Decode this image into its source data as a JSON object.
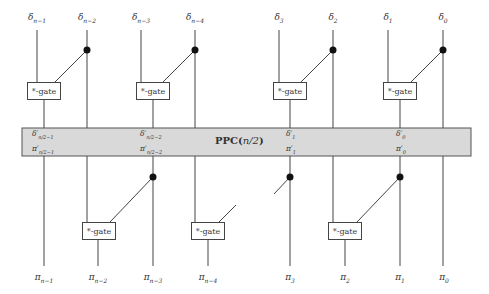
{
  "diagram": {
    "title": "PPC(n/2)",
    "band": {
      "label_prefix": "PPC(",
      "label_var": "n/2",
      "label_suffix": ")",
      "color": "#d9d9d9",
      "border": "#555555"
    },
    "gate_label": "*-gate",
    "inputs": [
      {
        "sym": "δ",
        "sub": "n−1",
        "x": 37
      },
      {
        "sym": "δ",
        "sub": "n−2",
        "x": 87
      },
      {
        "sym": "δ",
        "sub": "n−3",
        "x": 141
      },
      {
        "sym": "δ",
        "sub": "n−4",
        "x": 195
      },
      {
        "sym": "δ",
        "sub": "3",
        "x": 279
      },
      {
        "sym": "δ",
        "sub": "2",
        "x": 333
      },
      {
        "sym": "δ",
        "sub": "1",
        "x": 388
      },
      {
        "sym": "δ",
        "sub": "0",
        "x": 443
      }
    ],
    "outputs": [
      {
        "sym": "π",
        "sub": "n−1",
        "x": 44
      },
      {
        "sym": "π",
        "sub": "n−2",
        "x": 98
      },
      {
        "sym": "π",
        "sub": "n−3",
        "x": 153
      },
      {
        "sym": "π",
        "sub": "n−4",
        "x": 208
      },
      {
        "sym": "π",
        "sub": "3",
        "x": 290
      },
      {
        "sym": "π",
        "sub": "2",
        "x": 345
      },
      {
        "sym": "π",
        "sub": "1",
        "x": 400
      },
      {
        "sym": "π",
        "sub": "0",
        "x": 444
      }
    ],
    "band_labels_top": [
      {
        "sym": "δ′",
        "sub": "n/2−1",
        "x": 32
      },
      {
        "sym": "δ′",
        "sub": "n/2−2",
        "x": 140
      },
      {
        "sym": "δ′",
        "sub": "1",
        "x": 287
      },
      {
        "sym": "δ′",
        "sub": "0",
        "x": 396
      }
    ],
    "band_labels_bottom": [
      {
        "sym": "π′",
        "sub": "n/2−1",
        "x": 32
      },
      {
        "sym": "π′",
        "sub": "n/2−2",
        "x": 140
      },
      {
        "sym": "π′",
        "sub": "1",
        "x": 287
      },
      {
        "sym": "π′",
        "sub": "0",
        "x": 396
      }
    ]
  }
}
